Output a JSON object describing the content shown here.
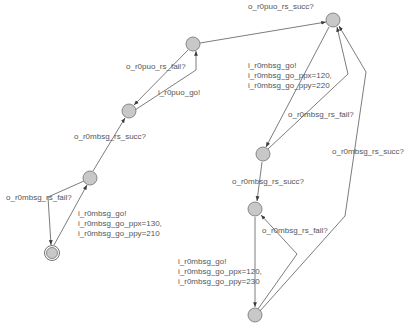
{
  "diagram": {
    "type": "state-machine",
    "colors": {
      "node_fill": "#c8c8c8",
      "node_stroke": "#707070",
      "edge": "#5a5a5a",
      "label": "#555555",
      "background": "#ffffff"
    },
    "nodes": [
      {
        "id": "N0",
        "x": 52,
        "y": 253,
        "initial": true
      },
      {
        "id": "N1",
        "x": 90,
        "y": 178
      },
      {
        "id": "N2",
        "x": 129,
        "y": 111
      },
      {
        "id": "N3",
        "x": 193,
        "y": 44
      },
      {
        "id": "N4",
        "x": 333,
        "y": 20
      },
      {
        "id": "N5",
        "x": 263,
        "y": 154
      },
      {
        "id": "N6",
        "x": 255,
        "y": 209
      },
      {
        "id": "N7",
        "x": 255,
        "y": 315
      }
    ],
    "edges": [
      {
        "from": "N0",
        "to": "N1",
        "label": "i_r0mbsg_go!\ni_r0mbsg_go_ppx=130,\ni_r0mbsg_go_ppy=210",
        "lx": 78,
        "ly": 209
      },
      {
        "from": "N1",
        "to": "N0",
        "label": "o_r0mbsg_rs_fail?",
        "lx": 6,
        "ly": 193
      },
      {
        "from": "N1",
        "to": "N2",
        "label": "o_r0mbsg_rs_succ?",
        "lx": 74,
        "ly": 132
      },
      {
        "from": "N2",
        "to": "N3",
        "label": "i_r0puo_go!",
        "lx": 158,
        "ly": 88
      },
      {
        "from": "N3",
        "to": "N2",
        "label": "o_r0puo_rs_fail?",
        "lx": 126,
        "ly": 62
      },
      {
        "from": "N3",
        "to": "N4",
        "label": "o_r0puo_rs_succ?",
        "lx": 248,
        "ly": 2
      },
      {
        "from": "N4",
        "to": "N5",
        "label": "i_r0mbsg_go!\ni_r0mbsg_go_ppx=120,\ni_r0mbsg_go_ppy=220",
        "lx": 248,
        "ly": 61
      },
      {
        "from": "N5",
        "to": "N4",
        "label": "o_r0mbsg_rs_fail?",
        "lx": 288,
        "ly": 110
      },
      {
        "from": "N5",
        "to": "N6",
        "label": "o_r0mbsg_rs_succ?",
        "lx": 232,
        "ly": 177
      },
      {
        "from": "N6",
        "to": "N7",
        "label": "i_r0mbsg_go!\ni_r0mbsg_go_ppx=120,\ni_r0mbsg_go_ppy=230",
        "lx": 178,
        "ly": 257
      },
      {
        "from": "N7",
        "to": "N6",
        "label": "o_r0mbsg_rs_fail?",
        "lx": 262,
        "ly": 226
      },
      {
        "from": "N7",
        "to": "N4",
        "label": "o_r0mbsg_rs_succ?",
        "lx": 332,
        "ly": 147
      }
    ]
  }
}
